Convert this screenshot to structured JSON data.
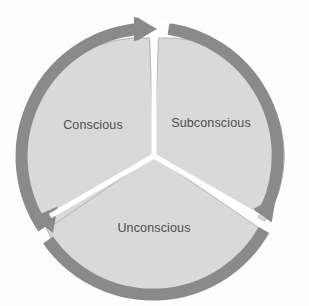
{
  "diagram": {
    "type": "cycle",
    "direction": "clockwise",
    "background_color": "#fdfdfd",
    "ring": {
      "color": "#8a8a8a",
      "outer_radius": 134,
      "thickness": 12,
      "center_x": 154,
      "center_y": 156
    },
    "segment_style": {
      "fill_color": "#d9d9d9",
      "edge_color": "#b4b4b4",
      "gap_color": "#ffffff",
      "inner_radius": 118
    },
    "label_color": "#4d4d4d",
    "segments": [
      {
        "id": "conscious",
        "label": "Conscious",
        "order": 1,
        "start_angle_deg": -120,
        "end_angle_deg": 0,
        "label_x": 93,
        "label_y": 125
      },
      {
        "id": "subconscious",
        "label": "Subconscious",
        "order": 2,
        "start_angle_deg": 0,
        "end_angle_deg": 120,
        "label_x": 211,
        "label_y": 123
      },
      {
        "id": "unconscious",
        "label": "Unconscious",
        "order": 3,
        "start_angle_deg": 120,
        "end_angle_deg": 240,
        "label_x": 154,
        "label_y": 228
      }
    ],
    "arrows": [
      {
        "id": "arrow-top",
        "points_to": "subconscious",
        "tip_x": 156,
        "tip_y": 19,
        "heading": "right"
      },
      {
        "id": "arrow-lower-right",
        "points_to": "unconscious",
        "tip_x": 272,
        "tip_y": 220,
        "heading": "down-left"
      },
      {
        "id": "arrow-lower-left",
        "points_to": "conscious",
        "tip_x": 36,
        "tip_y": 219,
        "heading": "up-left"
      }
    ],
    "watermark_lines": [
      {
        "text": "",
        "x": 154,
        "y": 90
      },
      {
        "text": "",
        "x": 154,
        "y": 175
      }
    ]
  }
}
